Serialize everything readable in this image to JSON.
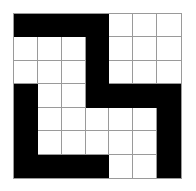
{
  "puzzle": {
    "rows": 7,
    "cols": 7,
    "colors": {
      "filled": "#000000",
      "empty": "#ffffff",
      "gridline": "#9a9a9a"
    },
    "grid": [
      [
        1,
        1,
        1,
        1,
        0,
        0,
        0
      ],
      [
        0,
        0,
        0,
        1,
        0,
        0,
        0
      ],
      [
        0,
        0,
        0,
        1,
        0,
        0,
        0
      ],
      [
        1,
        0,
        0,
        1,
        1,
        1,
        1
      ],
      [
        1,
        0,
        0,
        0,
        0,
        0,
        1
      ],
      [
        1,
        0,
        0,
        0,
        0,
        0,
        1
      ],
      [
        1,
        1,
        1,
        1,
        0,
        0,
        1
      ]
    ]
  }
}
